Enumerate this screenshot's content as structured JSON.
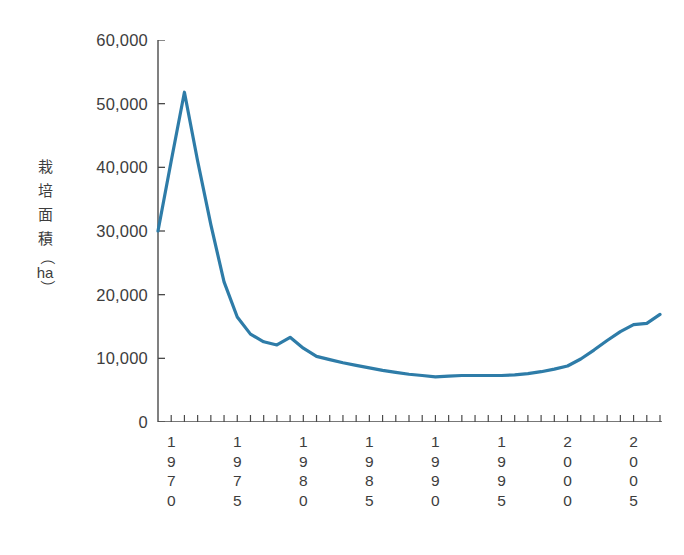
{
  "chart_data": {
    "type": "line",
    "title": "",
    "subtitle": "",
    "xlabel": "",
    "ylabel": "栽培面積（ha）",
    "ylabel_chars": [
      "栽",
      "培",
      "面",
      "積"
    ],
    "ylabel_unit": "ha",
    "ylabel_paren_open": "（",
    "ylabel_paren_close": "）",
    "ylim": [
      0,
      60000
    ],
    "ytick_values": [
      0,
      10000,
      20000,
      30000,
      40000,
      50000,
      60000
    ],
    "ytick_labels": [
      "0",
      "10,000",
      "20,000",
      "30,000",
      "40,000",
      "50,000",
      "60,000"
    ],
    "xlim": [
      1969,
      2007
    ],
    "xtick_labeled_years": [
      1970,
      1975,
      1980,
      1985,
      1990,
      1995,
      2000,
      2005
    ],
    "xtick_labels": [
      "1970",
      "1975",
      "1980",
      "1985",
      "1990",
      "1995",
      "2000",
      "2005"
    ],
    "grid": false,
    "legend": false,
    "line_color": "#2e7ca8",
    "axis_color": "#4a4a4a",
    "text_color": "#3d3d3d",
    "series": [
      {
        "name": "栽培面積",
        "x": [
          1969,
          1970,
          1971,
          1972,
          1973,
          1974,
          1975,
          1976,
          1977,
          1978,
          1979,
          1980,
          1981,
          1982,
          1983,
          1984,
          1985,
          1986,
          1987,
          1988,
          1989,
          1990,
          1991,
          1992,
          1993,
          1994,
          1995,
          1996,
          1997,
          1998,
          1999,
          2000,
          2001,
          2002,
          2003,
          2004,
          2005,
          2006,
          2007
        ],
        "values": [
          30000,
          41000,
          51800,
          41000,
          31000,
          22000,
          16500,
          13800,
          12600,
          12100,
          13300,
          11600,
          10300,
          9800,
          9300,
          8900,
          8500,
          8100,
          7800,
          7500,
          7300,
          7100,
          7200,
          7300,
          7300,
          7300,
          7300,
          7400,
          7600,
          7900,
          8300,
          8800,
          9900,
          11300,
          12800,
          14200,
          15300,
          15500,
          16900
        ]
      }
    ]
  }
}
